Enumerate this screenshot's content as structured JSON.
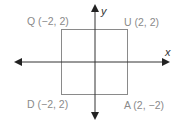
{
  "diagram": {
    "type": "coordinate-plane-square",
    "axes": {
      "x_label": "x",
      "y_label": "y"
    },
    "vertices": [
      {
        "name": "Q",
        "label": "Q (−2, 2)",
        "position": "top-left"
      },
      {
        "name": "U",
        "label": "U (2, 2)",
        "position": "top-right"
      },
      {
        "name": "D",
        "label": "D (−2, 2)",
        "position": "bottom-left"
      },
      {
        "name": "A",
        "label": "A (2, −2)",
        "position": "bottom-right"
      }
    ],
    "colors": {
      "square": "#8a8a8a",
      "axes": "#333333",
      "labels": "#8a8a8a"
    }
  }
}
